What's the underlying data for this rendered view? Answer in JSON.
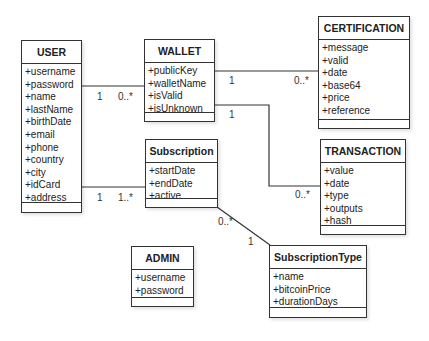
{
  "classes": {
    "user": {
      "name": "USER",
      "attributes": [
        "+username",
        "+password",
        "+name",
        "+lastName",
        "+birthDate",
        "+email",
        "+phone",
        "+country",
        "+city",
        "+idCard",
        "+address"
      ]
    },
    "wallet": {
      "name": "WALLET",
      "attributes": [
        "+publicKey",
        "+walletName",
        "+isValid",
        "+isUnknown"
      ]
    },
    "certification": {
      "name": "CERTIFICATION",
      "attributes": [
        "+message",
        "+valid",
        "+date",
        "+base64",
        "+price",
        "+reference"
      ]
    },
    "transaction": {
      "name": "TRANSACTION",
      "attributes": [
        "+value",
        "+date",
        "+type",
        "+outputs",
        "+hash"
      ]
    },
    "subscription": {
      "name": "Subscription",
      "attributes": [
        "+startDate",
        "+endDate",
        "+active"
      ]
    },
    "admin": {
      "name": "ADMIN",
      "attributes": [
        "+username",
        "+password"
      ]
    },
    "subscription_type": {
      "name": "SubscriptionType",
      "attributes": [
        "+name",
        "+bitcoinPrice",
        "+durationDays"
      ]
    }
  },
  "associations": [
    {
      "from": "USER",
      "to": "WALLET",
      "from_mult": "1",
      "to_mult": "0..*"
    },
    {
      "from": "USER",
      "to": "Subscription",
      "from_mult": "1",
      "to_mult": "1..*"
    },
    {
      "from": "WALLET",
      "to": "CERTIFICATION",
      "from_mult": "1",
      "to_mult": "0..*"
    },
    {
      "from": "WALLET",
      "to": "TRANSACTION",
      "from_mult": "1",
      "to_mult": "0..*"
    },
    {
      "from": "Subscription",
      "to": "SubscriptionType",
      "from_mult": "0..*",
      "to_mult": "1"
    }
  ],
  "colors": {
    "line": "#333333",
    "background": "#ffffff"
  }
}
